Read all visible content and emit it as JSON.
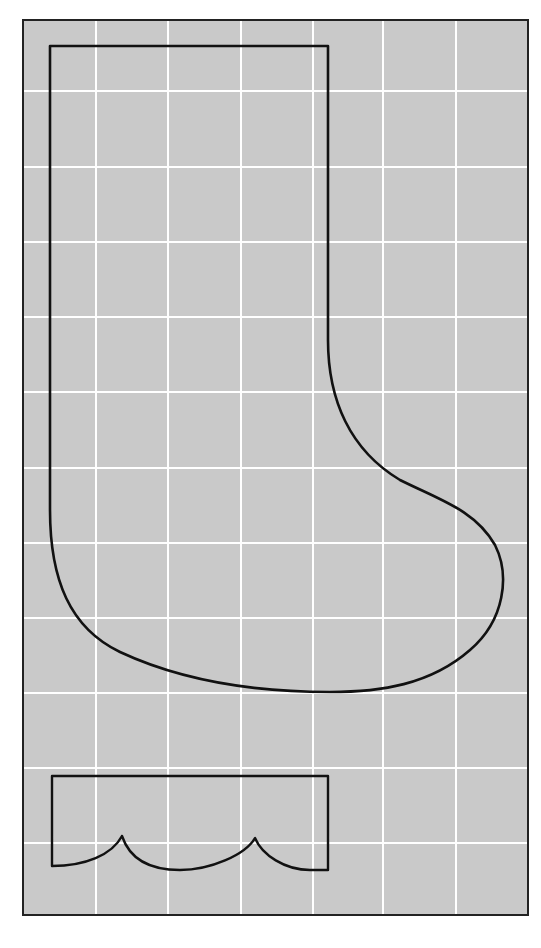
{
  "diagram": {
    "colors": {
      "background": "#ffffff",
      "panel": "#c9c9c9",
      "grid": "#ffffff",
      "outline": "#111111",
      "frame": "#222222"
    },
    "frame": {
      "x": 23,
      "y": 20,
      "width": 505,
      "height": 895
    },
    "grid": {
      "vertical_lines": [
        96,
        168,
        241,
        313,
        383,
        456
      ],
      "horizontal_lines": [
        91,
        167,
        242,
        317,
        392,
        468,
        543,
        618,
        693,
        768,
        843
      ]
    },
    "shapes": [
      {
        "name": "stocking-body",
        "description": "Stocking outline"
      },
      {
        "name": "stocking-cuff",
        "description": "Cuff with scalloped lower edge"
      }
    ]
  }
}
